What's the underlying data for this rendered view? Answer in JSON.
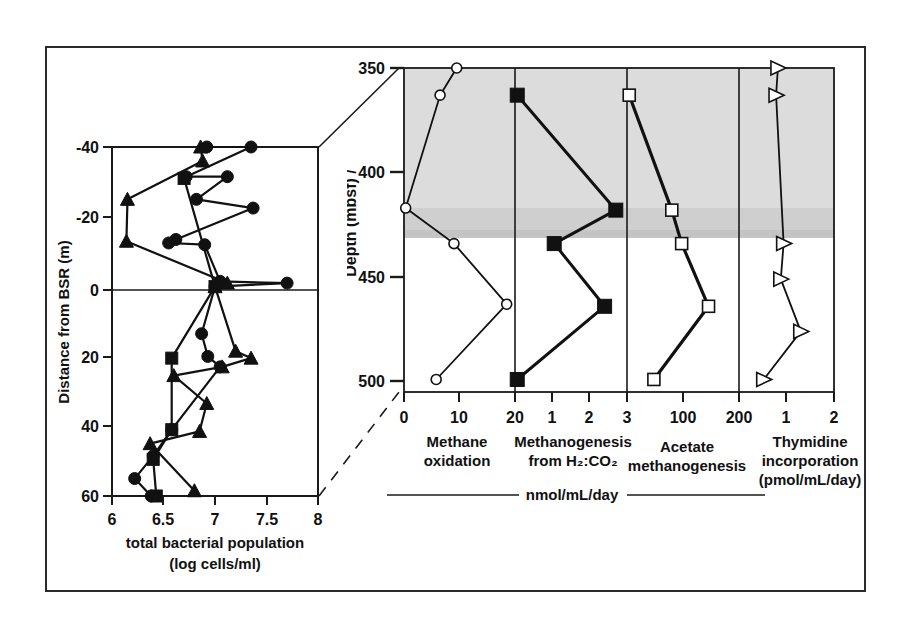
{
  "figure": {
    "border_color": "#2a2a2a",
    "background": "#ffffff",
    "shade_color": "#d9d9d9"
  },
  "chart_data": [
    {
      "type": "scatter",
      "id": "left-panel",
      "title": "",
      "xlabel_line1": "total bacterial population",
      "xlabel_line2": "(log cells/ml)",
      "ylabel": "Distance from BSR (m)",
      "xlim": [
        6,
        8
      ],
      "ylim": [
        -40,
        60
      ],
      "y_inverted": true,
      "grid": false,
      "xticks": [
        6,
        6.5,
        7,
        7.5,
        8
      ],
      "xticklabels": [
        "6",
        "6.5",
        "7",
        "7.5",
        "8"
      ],
      "yticks": [
        -40,
        -20,
        0,
        20,
        40,
        60
      ],
      "yticklabels": [
        "-40",
        "-20",
        "0",
        "20",
        "40",
        "60"
      ],
      "zero_line": 0,
      "series": [
        {
          "name": "Site A",
          "marker": "circle-filled",
          "points": [
            [
              6.92,
              -40.0
            ],
            [
              7.35,
              -40.0
            ],
            [
              6.72,
              -31.5
            ],
            [
              7.12,
              -31.5
            ],
            [
              6.82,
              -25.0
            ],
            [
              7.37,
              -22.5
            ],
            [
              6.62,
              -13.5
            ],
            [
              6.55,
              -12.5
            ],
            [
              6.9,
              -12.0
            ],
            [
              7.05,
              -1.5
            ],
            [
              7.7,
              -1.0
            ],
            [
              7.0,
              0.0
            ],
            [
              6.87,
              13.5
            ],
            [
              6.93,
              20.0
            ],
            [
              7.05,
              23.0
            ],
            [
              6.58,
              41.0
            ],
            [
              6.4,
              48.5
            ],
            [
              6.22,
              55.0
            ],
            [
              6.38,
              60.0
            ]
          ]
        },
        {
          "name": "Site B",
          "marker": "triangle-filled",
          "points": [
            [
              6.86,
              -40.0
            ],
            [
              6.88,
              -36.0
            ],
            [
              6.15,
              -25.0
            ],
            [
              6.14,
              -13.0
            ],
            [
              7.12,
              -1.0
            ],
            [
              7.0,
              0.0
            ],
            [
              7.2,
              18.5
            ],
            [
              7.35,
              20.5
            ],
            [
              7.07,
              23.0
            ],
            [
              6.6,
              25.5
            ],
            [
              6.92,
              33.5
            ],
            [
              6.85,
              41.5
            ],
            [
              6.37,
              45.0
            ],
            [
              6.8,
              58.5
            ]
          ]
        },
        {
          "name": "Site C",
          "marker": "square-filled",
          "points": [
            [
              6.7,
              -31.0
            ],
            [
              7.0,
              0.0
            ],
            [
              6.58,
              20.5
            ],
            [
              6.58,
              41.0
            ],
            [
              6.4,
              49.5
            ],
            [
              6.43,
              60.0
            ]
          ]
        }
      ]
    },
    {
      "type": "scatter",
      "id": "methane-oxidation",
      "xlabel_line1": "Methane",
      "xlabel_line2": "oxidation",
      "xlim": [
        0,
        20
      ],
      "xticks": [
        0,
        10,
        20
      ],
      "xticklabels": [
        "0",
        "10",
        "20"
      ],
      "marker": "circle-open",
      "points": [
        [
          9.5,
          350.0
        ],
        [
          6.5,
          363.0
        ],
        [
          0.3,
          417.0
        ],
        [
          9.0,
          434.0
        ],
        [
          18.5,
          463.0
        ],
        [
          5.8,
          499.0
        ]
      ]
    },
    {
      "type": "scatter",
      "id": "methanogenesis-h2co2",
      "xlabel_line1": "Methanogenesis",
      "xlabel_line2": "from H₂:CO₂",
      "xlim": [
        0,
        3
      ],
      "xticks": [
        1,
        2,
        3
      ],
      "xticklabels": [
        "1",
        "2",
        "3"
      ],
      "marker": "square-filled",
      "points": [
        [
          0.06,
          363.0
        ],
        [
          2.7,
          418.0
        ],
        [
          1.05,
          434.0
        ],
        [
          2.4,
          464.0
        ],
        [
          0.06,
          499.0
        ]
      ]
    },
    {
      "type": "scatter",
      "id": "acetate-methanogenesis",
      "xlabel_line1": "Acetate",
      "xlabel_line2": "methanogenesis",
      "xlim": [
        0,
        250
      ],
      "xticks": [
        100,
        200
      ],
      "xticklabels": [
        "100",
        "200"
      ],
      "marker": "square-open",
      "points": [
        [
          5,
          363.0
        ],
        [
          100,
          418.0
        ],
        [
          122,
          434.0
        ],
        [
          182,
          464.0
        ],
        [
          60,
          499.0
        ]
      ]
    },
    {
      "type": "scatter",
      "id": "thymidine-incorporation",
      "xlabel_line1": "Thymidine",
      "xlabel_line2": "incorporation",
      "xlabel_line3": "(pmol/mL/day)",
      "xlim": [
        0,
        2
      ],
      "xticks": [
        1,
        2
      ],
      "xticklabels": [
        "1",
        "2"
      ],
      "marker": "triangle-right-open",
      "points": [
        [
          0.82,
          350.0
        ],
        [
          0.78,
          363.0
        ],
        [
          0.94,
          434.0
        ],
        [
          0.88,
          451.0
        ],
        [
          1.3,
          476.0
        ],
        [
          0.52,
          499.0
        ]
      ]
    }
  ],
  "right_panel": {
    "ylabel": "Depth (mbsf) /",
    "ylim": [
      350,
      505
    ],
    "yticks": [
      350,
      400,
      450,
      500
    ],
    "yticklabels": [
      "350",
      "400",
      "450",
      "500"
    ],
    "shade_band": {
      "top": 350,
      "bottom": 440
    },
    "units_label": "nmol/mL/day"
  }
}
